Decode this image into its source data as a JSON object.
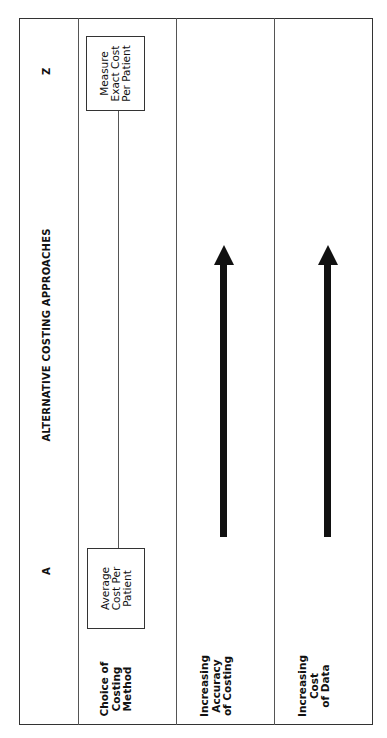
{
  "diagram": {
    "header": {
      "title": "ALTERNATIVE COSTING APPROACHES",
      "left_endpoint": "A",
      "right_endpoint": "Z"
    },
    "rows": [
      {
        "label": "Choice of\nCosting\nMethod",
        "left_box": "Average\nCost Per\nPatient",
        "right_box": "Measure\nExact Cost\nPer Patient",
        "connector": "line"
      },
      {
        "label": "Increasing\nAccuracy\nof Costing",
        "connector": "arrow-right"
      },
      {
        "label": "Increasing\nCost\nof Data",
        "connector": "arrow-right"
      }
    ],
    "caption_visible": "cut off at right edge"
  }
}
